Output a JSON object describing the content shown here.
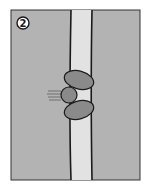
{
  "figure": {
    "step_number": "2",
    "colors": {
      "background": "#b3b3b3",
      "channel": "#e2e2e2",
      "blob": "#8a8a8a",
      "outline": "#1a1a1a",
      "badge_fill": "#ffffff"
    }
  }
}
